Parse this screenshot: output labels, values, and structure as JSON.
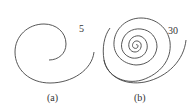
{
  "figures": [
    {
      "id": "a",
      "caption": "(a)",
      "label": "5",
      "stroke": "#444444"
    },
    {
      "id": "b",
      "caption": "(b)",
      "label": "30",
      "stroke": "#444444"
    }
  ]
}
